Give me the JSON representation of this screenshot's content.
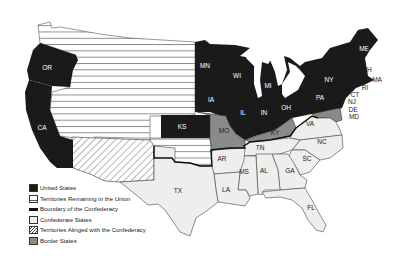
{
  "map": {
    "colors": {
      "united_states": "#1a1a1a",
      "territories_union": "#ffffff",
      "territory_lines": "#555555",
      "boundary": "#111111",
      "confederate": "#eeeeee",
      "territories_aligned": "#ffffff",
      "border_states": "#8a8a8a",
      "state_outline": "#333333"
    },
    "state_labels": {
      "OR": "OR",
      "CA": "CA",
      "MN": "MN",
      "WI": "WI",
      "IA": "IA",
      "MI": "MI",
      "IL": "IL",
      "IN": "IN",
      "OH": "OH",
      "KS": "KS",
      "MO": "MO",
      "KY": "KY",
      "PA": "PA",
      "NY": "NY",
      "VT": "VT",
      "ME": "ME",
      "NH": "NH",
      "MA": "MA",
      "RI": "RI",
      "CT": "CT",
      "NJ": "NJ",
      "DE": "DE",
      "MD": "MD",
      "VA": "VA",
      "NC": "NC",
      "TN": "TN",
      "SC": "SC",
      "AR": "AR",
      "MS": "MS",
      "AL": "AL",
      "GA": "GA",
      "LA": "LA",
      "TX": "TX",
      "FL": "FL"
    }
  },
  "legend": {
    "items": [
      {
        "key": "united_states",
        "label": "United States"
      },
      {
        "key": "territories_union",
        "label": "Territories Remaining in the Union"
      },
      {
        "key": "boundary",
        "label": "Boundary of the Confederacy"
      },
      {
        "key": "confederate",
        "label": "Confederate States"
      },
      {
        "key": "territories_aligned",
        "label": "Territories Alinged with the Confederacy"
      },
      {
        "key": "border_states",
        "label": "Border States"
      }
    ]
  }
}
